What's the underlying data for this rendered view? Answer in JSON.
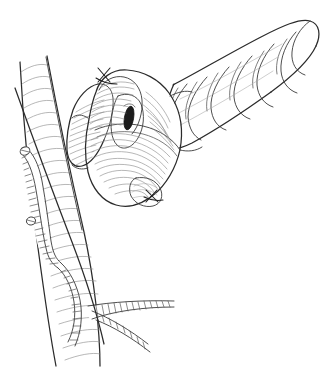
{
  "figure": {
    "title": "Pancreatic stump with body and tail overlying the portal vein",
    "medium": "black and white pen-and-ink line drawing",
    "background_color": "#ffffff",
    "line_color": "#2b2b2b",
    "hatch_color": "#8a8a8a",
    "duct_color": "#1c1c1c",
    "width_px": 333,
    "height_px": 368,
    "visible_text": ""
  },
  "structures": {
    "pancreas_tail": {
      "name": "pancreas-body-and-tail",
      "description": "Lobulated elongated gland extending from upper right down to the left toward the stump",
      "lobule_count": 7
    },
    "pancreas_stump": {
      "name": "pancreatic-stump-cut-surface",
      "description": "Rounded transected end of the pancreas shown with dense parallel hatching"
    },
    "pancreatic_duct": {
      "name": "pancreatic-duct-orifice",
      "description": "Dark elongated oval opening on the cut surface of the stump"
    },
    "portal_vein": {
      "name": "portal-vein",
      "description": "Broad vertically running vessel with regular transverse striations passing behind the stump"
    },
    "splenic_vein": {
      "name": "splenic-vein-stump",
      "description": "Narrow striated vessel behind the portal vein on the left with two ligature clips"
    },
    "vein_branch": {
      "name": "venous-branch",
      "description": "Small striated branch leaving the main vessel at the lower right"
    },
    "sutures": {
      "name": "stay-sutures",
      "count": 2,
      "description": "Two cross-shaped stay sutures at the superior and inferior margins of the stump"
    },
    "clips": {
      "name": "ligature-clips",
      "count": 2,
      "description": "Two small knob-shaped ligature clips on the posterior vein"
    }
  }
}
